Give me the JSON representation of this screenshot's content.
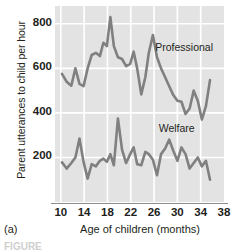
{
  "figure": {
    "panel_label": "(a)",
    "note": "FIGURE"
  },
  "chart_data": {
    "type": "line",
    "title": "",
    "xlabel": "Age of children (months)",
    "ylabel": "Parent utterances to child per hour",
    "xlim": [
      9,
      38
    ],
    "ylim": [
      0,
      880
    ],
    "xticks": [
      10,
      14,
      18,
      22,
      26,
      30,
      34,
      38
    ],
    "yticks": [
      200,
      400,
      600,
      800
    ],
    "grid": true,
    "legend": "inline-annotations",
    "plot_background": "#e3e3e3",
    "gridline_color": "#ffffff",
    "line_color": "#808080",
    "series": [
      {
        "name": "Professional",
        "label": "Professional",
        "label_x": 26.2,
        "label_y": 690,
        "color": "#808080",
        "x": [
          10.2,
          11.0,
          11.8,
          12.5,
          13.2,
          13.9,
          14.6,
          15.3,
          16.0,
          16.7,
          17.3,
          17.9,
          18.5,
          19.1,
          19.8,
          20.5,
          21.2,
          21.9,
          22.5,
          23.1,
          23.8,
          24.5,
          25.1,
          25.8,
          26.5,
          27.2,
          27.9,
          28.6,
          29.3,
          30.0,
          30.7,
          31.4,
          32.1,
          32.8,
          33.5,
          34.2,
          34.9,
          35.6
        ],
        "y": [
          575,
          540,
          522,
          600,
          530,
          520,
          600,
          660,
          670,
          655,
          715,
          700,
          830,
          700,
          650,
          642,
          610,
          620,
          675,
          600,
          483,
          560,
          670,
          750,
          650,
          600,
          560,
          520,
          480,
          455,
          450,
          395,
          420,
          500,
          455,
          370,
          430,
          548
        ],
        "ymin_observed": 370,
        "ymax_observed": 830
      },
      {
        "name": "Welfare",
        "label": "Welfare",
        "label_x": 26.8,
        "label_y": 330,
        "color": "#808080",
        "x": [
          10.2,
          11.0,
          11.8,
          12.5,
          13.2,
          13.9,
          14.6,
          15.3,
          16.0,
          16.7,
          17.3,
          17.9,
          18.5,
          19.1,
          19.8,
          20.5,
          21.2,
          21.9,
          22.5,
          23.1,
          23.8,
          24.5,
          25.1,
          25.8,
          26.5,
          27.2,
          27.9,
          28.6,
          29.3,
          30.0,
          30.7,
          31.4,
          32.1,
          32.8,
          33.5,
          34.2,
          34.9,
          35.6
        ],
        "y": [
          178,
          150,
          175,
          200,
          285,
          180,
          105,
          170,
          160,
          185,
          195,
          180,
          215,
          165,
          375,
          235,
          175,
          215,
          245,
          170,
          165,
          225,
          215,
          190,
          120,
          215,
          240,
          280,
          230,
          185,
          245,
          215,
          150,
          175,
          200,
          160,
          185,
          100
        ],
        "ymin_observed": 100,
        "ymax_observed": 375
      }
    ]
  }
}
